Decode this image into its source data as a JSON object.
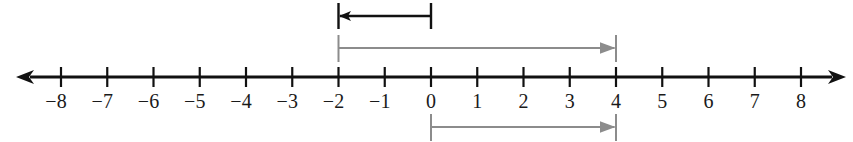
{
  "diagram": {
    "type": "number-line",
    "axis": {
      "min": -8,
      "max": 8,
      "step": 1,
      "tick_labels": [
        "−8",
        "−7",
        "−6",
        "−5",
        "−4",
        "−3",
        "−2",
        "−1",
        "0",
        "1",
        "2",
        "3",
        "4",
        "5",
        "6",
        "7",
        "8"
      ],
      "arrows_both_ends": true,
      "color": "#111111"
    },
    "vectors": [
      {
        "name": "top-black-arrow",
        "from": 0,
        "to": -2,
        "color": "#111111",
        "row": "top"
      },
      {
        "name": "middle-gray-arrow",
        "from": -2,
        "to": 4,
        "color": "#8c8c8c",
        "row": "above-axis"
      },
      {
        "name": "bottom-gray-arrow",
        "from": 0,
        "to": 4,
        "color": "#8c8c8c",
        "row": "below-axis"
      }
    ]
  }
}
